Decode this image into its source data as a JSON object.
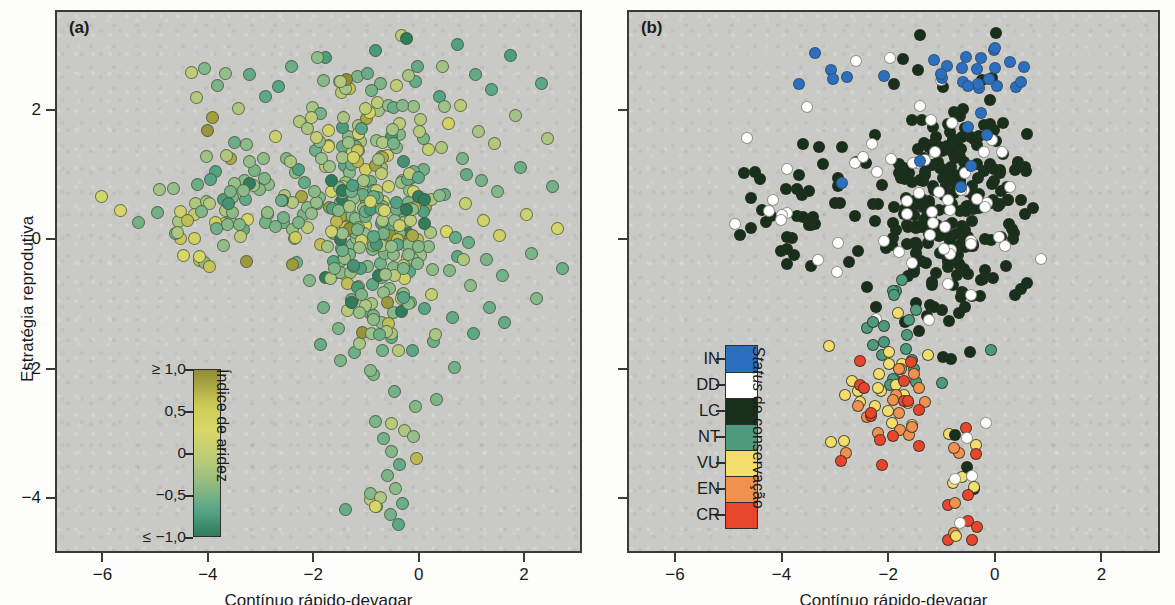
{
  "figure": {
    "background": "#c9c9c5",
    "frame_color": "#3a3a38"
  },
  "panels": [
    {
      "tag": "(a)",
      "xlabel": "Contínuo rápido-devagar",
      "ylabel": "Estratégia reprodutiva"
    },
    {
      "tag": "(b)",
      "xlabel": "Contínuo rápido-devagar",
      "ylabel": "Estratégia reprodutiva"
    }
  ],
  "axes": {
    "xticks": [
      -6,
      -4,
      -2,
      0,
      2
    ],
    "xticklabels": [
      "−6",
      "−4",
      "−2",
      "0",
      "2"
    ],
    "yticks": [
      2,
      0,
      -2,
      -4
    ],
    "yticklabels": [
      "2",
      "0",
      "−2",
      "−4"
    ],
    "xlim": [
      -6.9,
      3.1
    ],
    "ylim": [
      -4.85,
      3.55
    ]
  },
  "colorbar_legend": {
    "title": "Índice de aridez",
    "ticklabels": [
      "≥ 1,0",
      "0,5",
      "0",
      "−0,5",
      "≤ −1,0"
    ],
    "tickvalues": [
      1.0,
      0.5,
      0,
      -0.5,
      -1.0
    ],
    "gradient_top": "#8f8b35",
    "gradient_mid_high": "#d9d765",
    "gradient_mid": "#9cc18a",
    "gradient_low": "#54a486",
    "gradient_bottom": "#2f7b5c"
  },
  "status_legend": {
    "title_italic": "Status",
    "title_rest": " de conservação",
    "items": [
      {
        "code": "IN",
        "color": "#2b6fc0"
      },
      {
        "code": "DD",
        "color": "#ffffff"
      },
      {
        "code": "LC",
        "color": "#18301a"
      },
      {
        "code": "NT",
        "color": "#4f9a7c"
      },
      {
        "code": "VU",
        "color": "#f3dd6b"
      },
      {
        "code": "EN",
        "color": "#f0914e"
      },
      {
        "code": "CR",
        "color": "#e8462c"
      }
    ]
  },
  "chart_data": [
    {
      "type": "scatter",
      "panel": "(a)",
      "title": "",
      "xlabel": "Contínuo rápido-devagar",
      "ylabel": "Estratégia reprodutiva",
      "xlim": [
        -6.9,
        3.1
      ],
      "ylim": [
        -4.85,
        3.55
      ],
      "grid": false,
      "colormap": "aridity index (yellow-brown high → green low)",
      "color_variable": "Índice de aridez",
      "color_range": [
        -1.0,
        1.0
      ],
      "n_points": 470,
      "points": [
        [
          -6.05,
          0.7,
          0.55
        ],
        [
          -5.7,
          0.48,
          0.6
        ],
        [
          -5.35,
          0.3,
          -0.25
        ],
        [
          -4.55,
          0.05,
          0.7
        ],
        [
          -4.3,
          0.04,
          0.65
        ],
        [
          -4.5,
          -0.22,
          0.6
        ],
        [
          -4.2,
          -0.3,
          0.75
        ],
        [
          -4.1,
          -0.33,
          -0.1
        ],
        [
          -4.0,
          -0.38,
          0.72
        ],
        [
          -4.35,
          2.62,
          0.3
        ],
        [
          -4.1,
          2.68,
          -0.15
        ],
        [
          -4.25,
          2.22,
          0.2
        ],
        [
          -3.85,
          2.42,
          -0.2
        ],
        [
          -3.7,
          2.6,
          -0.05
        ],
        [
          -3.95,
          1.92,
          0.9
        ],
        [
          -4.05,
          1.72,
          0.95
        ],
        [
          -3.6,
          1.28,
          0.85
        ],
        [
          -3.45,
          2.05,
          0.15
        ],
        [
          -3.3,
          1.5,
          -0.1
        ],
        [
          -3.25,
          2.58,
          -0.35
        ],
        [
          -3.15,
          1.1,
          -0.2
        ],
        [
          -3.05,
          0.82,
          -0.15
        ],
        [
          -2.95,
          2.25,
          -0.4
        ],
        [
          -2.9,
          0.42,
          -0.2
        ],
        [
          -2.75,
          1.62,
          0.45
        ],
        [
          -2.7,
          2.4,
          -0.45
        ],
        [
          -2.6,
          0.3,
          -0.25
        ],
        [
          -2.55,
          1.28,
          -0.15
        ],
        [
          -2.45,
          2.7,
          -0.3
        ],
        [
          -2.4,
          0.05,
          -0.1
        ],
        [
          -2.35,
          -0.32,
          -0.25
        ],
        [
          -2.3,
          1.85,
          0.2
        ],
        [
          -2.2,
          0.92,
          -0.35
        ],
        [
          -2.15,
          0.22,
          0.3
        ],
        [
          -2.1,
          -0.6,
          -0.15
        ],
        [
          -2.05,
          2.08,
          0.1
        ],
        [
          -2.0,
          1.4,
          -0.3
        ],
        [
          -1.95,
          0.58,
          -0.2
        ],
        [
          -1.9,
          -0.05,
          0.75
        ],
        [
          -1.85,
          -1.02,
          -0.25
        ],
        [
          -1.8,
          2.85,
          -0.55
        ],
        [
          -1.75,
          1.72,
          0.65
        ],
        [
          -1.7,
          0.78,
          0.5
        ],
        [
          -1.65,
          0.12,
          -0.3
        ],
        [
          -1.6,
          -0.48,
          -0.1
        ],
        [
          -1.55,
          -1.35,
          -0.2
        ],
        [
          -1.5,
          2.3,
          0.25
        ],
        [
          -1.45,
          1.18,
          -0.4
        ],
        [
          -1.4,
          0.45,
          0.35
        ],
        [
          -1.35,
          -0.15,
          -0.25
        ],
        [
          -1.3,
          -0.92,
          -0.05
        ],
        [
          -1.25,
          -1.72,
          -0.3
        ],
        [
          -1.2,
          2.55,
          -0.2
        ],
        [
          -1.15,
          1.55,
          0.15
        ],
        [
          -1.1,
          0.88,
          -0.35
        ],
        [
          -1.05,
          0.25,
          0.6
        ],
        [
          -1.0,
          -0.38,
          -0.15
        ],
        [
          -0.95,
          -1.12,
          -0.3
        ],
        [
          -0.9,
          -2.05,
          -0.2
        ],
        [
          -0.85,
          2.95,
          -0.6
        ],
        [
          -0.8,
          2.02,
          0.05
        ],
        [
          -0.75,
          1.32,
          -0.25
        ],
        [
          -0.7,
          0.62,
          0.45
        ],
        [
          -0.65,
          0.02,
          -0.2
        ],
        [
          -0.6,
          -0.72,
          -0.1
        ],
        [
          -0.55,
          -1.48,
          -0.35
        ],
        [
          -0.5,
          -2.32,
          -0.25
        ],
        [
          -0.45,
          2.42,
          0.3
        ],
        [
          -0.4,
          1.65,
          -0.15
        ],
        [
          -0.35,
          0.95,
          0.7
        ],
        [
          -0.3,
          0.35,
          -0.3
        ],
        [
          -0.25,
          -0.25,
          0.55
        ],
        [
          -0.2,
          -0.95,
          -0.2
        ],
        [
          -0.15,
          -1.68,
          -0.4
        ],
        [
          -0.1,
          -2.55,
          -0.15
        ],
        [
          -0.05,
          2.7,
          -0.35
        ],
        [
          0.0,
          1.88,
          0.2
        ],
        [
          0.05,
          1.12,
          -0.25
        ],
        [
          0.1,
          0.52,
          0.85
        ],
        [
          0.15,
          -0.08,
          -0.1
        ],
        [
          0.2,
          -0.82,
          0.35
        ],
        [
          0.25,
          -1.55,
          -0.3
        ],
        [
          0.3,
          -2.45,
          -0.2
        ],
        [
          0.35,
          2.25,
          -0.45
        ],
        [
          0.4,
          1.45,
          0.15
        ],
        [
          0.45,
          0.72,
          -0.3
        ],
        [
          0.5,
          0.15,
          0.6
        ],
        [
          0.55,
          -0.45,
          -0.15
        ],
        [
          0.6,
          -1.18,
          -0.35
        ],
        [
          0.65,
          -1.95,
          -0.25
        ],
        [
          0.7,
          3.05,
          -0.5
        ],
        [
          0.75,
          2.1,
          0.25
        ],
        [
          0.8,
          1.28,
          -0.2
        ],
        [
          0.85,
          0.58,
          0.4
        ],
        [
          0.9,
          -0.02,
          -0.3
        ],
        [
          0.95,
          -0.68,
          -0.1
        ],
        [
          1.0,
          -1.42,
          -0.4
        ],
        [
          1.05,
          2.58,
          -0.35
        ],
        [
          1.1,
          1.7,
          0.1
        ],
        [
          1.15,
          0.95,
          -0.25
        ],
        [
          1.2,
          0.32,
          0.5
        ],
        [
          1.25,
          -0.28,
          -0.2
        ],
        [
          1.3,
          -1.02,
          -0.3
        ],
        [
          1.35,
          2.35,
          -0.4
        ],
        [
          1.4,
          1.52,
          0.2
        ],
        [
          1.45,
          0.78,
          -0.15
        ],
        [
          1.5,
          0.1,
          0.65
        ],
        [
          1.55,
          -0.52,
          -0.25
        ],
        [
          1.6,
          -1.25,
          -0.35
        ],
        [
          1.7,
          2.88,
          -0.55
        ],
        [
          1.8,
          1.95,
          0.05
        ],
        [
          1.9,
          1.15,
          -0.3
        ],
        [
          2.0,
          0.42,
          0.45
        ],
        [
          2.1,
          -0.18,
          -0.2
        ],
        [
          2.2,
          -0.88,
          -0.15
        ],
        [
          2.3,
          2.45,
          -0.4
        ],
        [
          2.4,
          1.6,
          0.15
        ],
        [
          2.5,
          0.85,
          -0.25
        ],
        [
          2.6,
          0.2,
          0.55
        ],
        [
          2.7,
          -0.42,
          -0.3
        ],
        [
          -0.7,
          -3.05,
          -0.25
        ],
        [
          -0.55,
          -3.25,
          -0.15
        ],
        [
          -0.4,
          -3.45,
          -0.35
        ],
        [
          -0.62,
          -3.62,
          -0.2
        ],
        [
          -0.48,
          -3.82,
          -0.1
        ],
        [
          -0.35,
          -4.05,
          -0.3
        ],
        [
          -0.58,
          -4.22,
          -0.25
        ],
        [
          -0.42,
          -4.38,
          -0.4
        ],
        [
          -0.3,
          -2.92,
          0.15
        ],
        [
          -0.85,
          -2.78,
          -0.2
        ]
      ]
    },
    {
      "type": "scatter",
      "panel": "(b)",
      "title": "",
      "xlabel": "Contínuo rápido-devagar",
      "ylabel": "Estratégia reprodutiva",
      "xlim": [
        -6.9,
        3.1
      ],
      "ylim": [
        -4.85,
        3.55
      ],
      "grid": false,
      "color_variable": "Status de conservação",
      "categories": [
        "IN",
        "DD",
        "LC",
        "NT",
        "VU",
        "EN",
        "CR"
      ],
      "category_colors": [
        "#2b6fc0",
        "#ffffff",
        "#18301a",
        "#4f9a7c",
        "#f3dd6b",
        "#f0914e",
        "#e8462c"
      ],
      "n_points": 470,
      "category_counts": {
        "IN": 34,
        "DD": 62,
        "LC": 300,
        "NT": 22,
        "VU": 22,
        "EN": 15,
        "CR": 15
      }
    }
  ]
}
